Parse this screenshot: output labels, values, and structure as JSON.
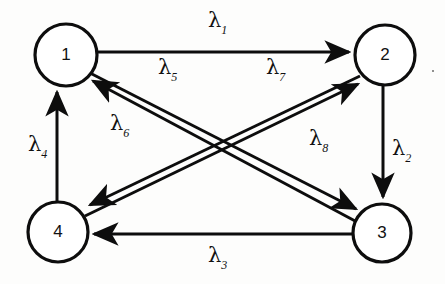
{
  "figure": {
    "type": "directed-graph",
    "title": "",
    "background_color": "#fdfdfc",
    "stroke_color": "#0d0d0d",
    "nodes": [
      {
        "id": "1",
        "label": "1",
        "cx": 66,
        "cy": 55,
        "r": 31
      },
      {
        "id": "2",
        "label": "2",
        "cx": 385,
        "cy": 55,
        "r": 30
      },
      {
        "id": "3",
        "label": "3",
        "cx": 382,
        "cy": 233,
        "r": 29
      },
      {
        "id": "4",
        "label": "4",
        "cx": 58,
        "cy": 232,
        "r": 30
      }
    ],
    "edges": [
      {
        "id": "e1",
        "label": "λ",
        "sub": "1",
        "from": "1",
        "to": "2",
        "x1": 98,
        "y1": 52,
        "x2": 353,
        "y2": 52,
        "label_x": 208,
        "label_y": 10
      },
      {
        "id": "e2",
        "label": "λ",
        "sub": "2",
        "from": "2",
        "to": "3",
        "x1": 383,
        "y1": 86,
        "x2": 383,
        "y2": 200,
        "label_x": 392,
        "label_y": 138
      },
      {
        "id": "e3",
        "label": "λ",
        "sub": "3",
        "from": "3",
        "to": "4",
        "x1": 352,
        "y1": 234,
        "x2": 90,
        "y2": 234,
        "label_x": 208,
        "label_y": 245
      },
      {
        "id": "e4",
        "label": "λ",
        "sub": "4",
        "from": "4",
        "to": "1",
        "x1": 57,
        "y1": 202,
        "x2": 57,
        "y2": 89,
        "label_x": 28,
        "label_y": 134
      },
      {
        "id": "e5",
        "label": "λ",
        "sub": "5",
        "from": "1",
        "to": "3",
        "x1": 90,
        "y1": 73,
        "x2": 360,
        "y2": 211,
        "label_x": 158,
        "label_y": 57
      },
      {
        "id": "e6",
        "label": "λ",
        "sub": "6",
        "from": "3",
        "to": "1",
        "x1": 357,
        "y1": 222,
        "x2": 89,
        "y2": 79,
        "label_x": 110,
        "label_y": 113
      },
      {
        "id": "e7",
        "label": "λ",
        "sub": "7",
        "from": "2",
        "to": "4",
        "x1": 360,
        "y1": 76,
        "x2": 86,
        "y2": 207,
        "label_x": 266,
        "label_y": 57
      },
      {
        "id": "e8",
        "label": "λ",
        "sub": "8",
        "from": "4",
        "to": "2",
        "x1": 85,
        "y1": 216,
        "x2": 362,
        "y2": 82,
        "label_x": 309,
        "label_y": 128
      }
    ],
    "artifacts": [
      {
        "name": "ink-speck",
        "x": 432,
        "y": 70
      }
    ]
  }
}
